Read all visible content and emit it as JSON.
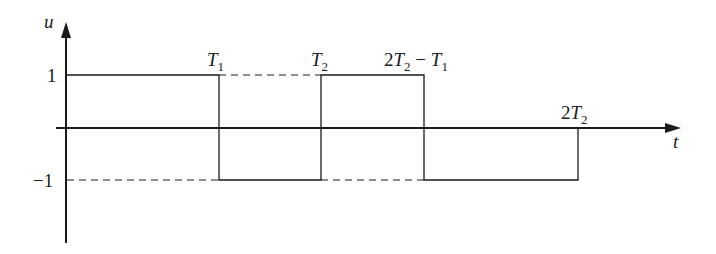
{
  "diagram": {
    "type": "square-wave-signal",
    "axes": {
      "y_label": "u",
      "x_label": "t"
    },
    "y_ticks": [
      {
        "value": 1,
        "label": "1"
      },
      {
        "value": -1,
        "label": "−1"
      }
    ],
    "x_markers": [
      {
        "id": "T1",
        "main": "T",
        "sub": "1",
        "prefix": "",
        "suffix": ""
      },
      {
        "id": "T2",
        "main": "T",
        "sub": "2",
        "prefix": "",
        "suffix": ""
      },
      {
        "id": "2T2-T1",
        "prefix": "2",
        "main": "T",
        "sub": "2",
        "suffix": " − ",
        "main2": "T",
        "sub2": "1"
      },
      {
        "id": "2T2",
        "prefix": "2",
        "main": "T",
        "sub": "2",
        "suffix": ""
      }
    ],
    "segments": [
      {
        "from": "0",
        "to": "T1",
        "value": 1
      },
      {
        "from": "T1",
        "to": "T2",
        "value": -1
      },
      {
        "from": "T2",
        "to": "2T2-T1",
        "value": 1
      },
      {
        "from": "2T2-T1",
        "to": "2T2",
        "value": -1
      }
    ],
    "colors": {
      "line": "#1a1a1a",
      "background": "#ffffff"
    }
  }
}
